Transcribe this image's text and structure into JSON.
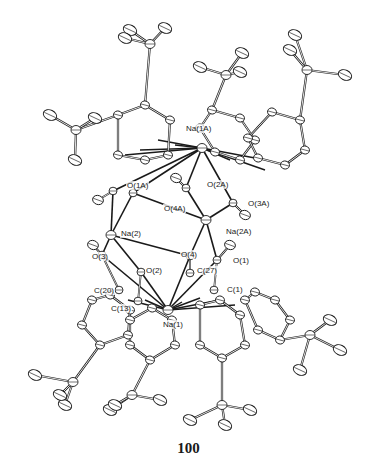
{
  "figure": {
    "caption": "100",
    "colors": {
      "bond": "#1a1a1a",
      "atom_fill": "#ffffff",
      "atom_stroke": "#1a1a1a",
      "background": "#ffffff"
    },
    "labels": [
      {
        "id": "Na1A",
        "text": "Na(1A)",
        "x": 185,
        "y": 124
      },
      {
        "id": "O1A",
        "text": "O(1A)",
        "x": 126,
        "y": 181
      },
      {
        "id": "O2A",
        "text": "O(2A)",
        "x": 206,
        "y": 180
      },
      {
        "id": "O4A",
        "text": "O(4A)",
        "x": 163,
        "y": 204
      },
      {
        "id": "O3A",
        "text": "O(3A)",
        "x": 247,
        "y": 199
      },
      {
        "id": "Na2",
        "text": "Na(2)",
        "x": 120,
        "y": 229
      },
      {
        "id": "Na2A",
        "text": "Na(2A)",
        "x": 225,
        "y": 227
      },
      {
        "id": "O3",
        "text": "O(3)",
        "x": 91,
        "y": 252
      },
      {
        "id": "O4",
        "text": "O(4)",
        "x": 180,
        "y": 250
      },
      {
        "id": "O1",
        "text": "O(1)",
        "x": 232,
        "y": 256
      },
      {
        "id": "O2",
        "text": "O(2)",
        "x": 145,
        "y": 266
      },
      {
        "id": "C27",
        "text": "C(27)",
        "x": 196,
        "y": 266
      },
      {
        "id": "C20",
        "text": "C(20)",
        "x": 93,
        "y": 286
      },
      {
        "id": "C1",
        "text": "C(1)",
        "x": 226,
        "y": 285
      },
      {
        "id": "C13",
        "text": "C(13)",
        "x": 110,
        "y": 304
      },
      {
        "id": "Na1",
        "text": "Na(1)",
        "x": 162,
        "y": 320
      }
    ],
    "core_atoms": {
      "Na1A": [
        202,
        148
      ],
      "O1A": [
        113,
        191
      ],
      "O4A": [
        133,
        193
      ],
      "O2A": [
        186,
        188
      ],
      "O3A": [
        233,
        203
      ],
      "Na2A": [
        206,
        220
      ],
      "Na2": [
        111,
        235
      ],
      "O3": [
        102,
        255
      ],
      "O4": [
        190,
        256
      ],
      "O1": [
        217,
        260
      ],
      "O2": [
        141,
        272
      ],
      "C27": [
        190,
        273
      ],
      "C1": [
        214,
        290
      ],
      "C20": [
        119,
        290
      ],
      "C13": [
        138,
        301
      ],
      "Na1": [
        168,
        310
      ]
    },
    "chart_data": {
      "type": "molecular-structure",
      "title": "100",
      "description": "ORTEP thermal-ellipsoid plot of a centrosymmetric sodium aryloxide cluster with tert-butyl substituted aromatic rings",
      "atoms_labeled": [
        "Na(1A)",
        "O(1A)",
        "O(2A)",
        "O(4A)",
        "O(3A)",
        "Na(2)",
        "Na(2A)",
        "O(3)",
        "O(4)",
        "O(1)",
        "O(2)",
        "C(27)",
        "C(20)",
        "C(1)",
        "C(13)",
        "Na(1)"
      ]
    }
  }
}
